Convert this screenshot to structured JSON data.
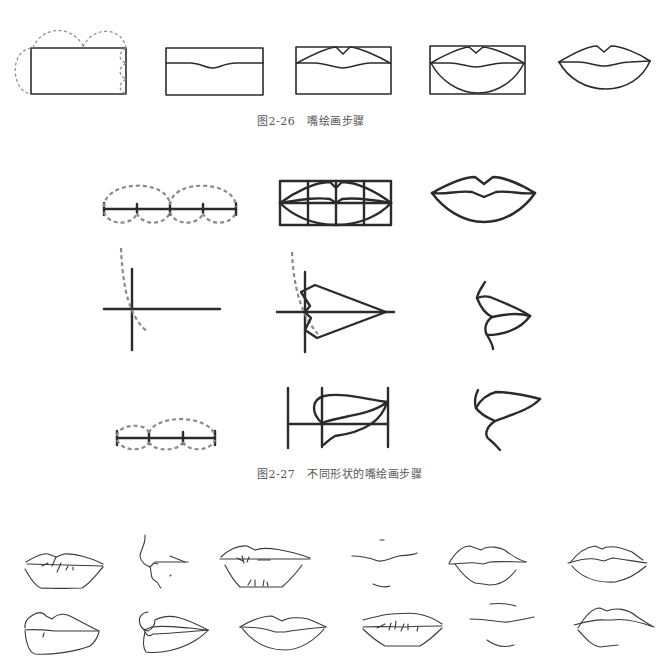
{
  "figures": [
    {
      "id": "fig-2-26",
      "caption_number": "图2-26",
      "caption_title": "嘴绘画步骤",
      "steps": [
        "step-1-proportion-box-with-dashed-arcs",
        "step-2-box-with-mouth-line",
        "step-3-box-with-upper-lip",
        "step-4-box-with-full-lips",
        "step-5-finished-lips"
      ]
    },
    {
      "id": "fig-2-27",
      "caption_number": "图2-27",
      "caption_title": "不同形状的嘴绘画步骤",
      "rows": [
        [
          "front-measure-line",
          "front-grid-construction",
          "front-finished-lips"
        ],
        [
          "profile-cross-axes",
          "profile-wedge-construction",
          "profile-finished-lips"
        ],
        [
          "three-quarter-measure-line",
          "three-quarter-grid-construction",
          "three-quarter-finished-lips"
        ]
      ]
    }
  ],
  "gallery": {
    "label": "lip-shape-variations",
    "count": 12
  },
  "colors": {
    "line": "#2b2b2b",
    "dashed_guide": "#8a8a8a",
    "caption_text": "#555555",
    "background": "#ffffff"
  }
}
